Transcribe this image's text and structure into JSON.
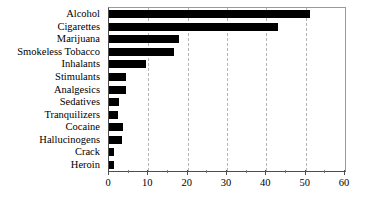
{
  "chart_data": {
    "type": "bar",
    "orientation": "horizontal",
    "title": "",
    "subtitle": "",
    "xlabel": "",
    "ylabel": "",
    "xlim": [
      0,
      60
    ],
    "xticks": [
      0,
      10,
      20,
      30,
      40,
      50,
      60
    ],
    "xtick_labels": [
      "0",
      "10",
      "20",
      "30",
      "40",
      "50",
      "60"
    ],
    "minor_xticks": [
      5,
      15,
      25,
      35,
      45,
      55
    ],
    "grid": "vertical-dashed",
    "legend": "none",
    "bar_color": "#000000",
    "categories": [
      "Alcohol",
      "Cigarettes",
      "Marijuana",
      "Smokeless Tobacco",
      "Inhalants",
      "Stimulants",
      "Analgesics",
      "Sedatives",
      "Tranquilizers",
      "Cocaine",
      "Hallucinogens",
      "Crack",
      "Heroin"
    ],
    "values": [
      51,
      43,
      17.8,
      16.5,
      9.5,
      4.3,
      4.3,
      2.5,
      2.4,
      3.5,
      3.4,
      1.3,
      1.3
    ]
  }
}
